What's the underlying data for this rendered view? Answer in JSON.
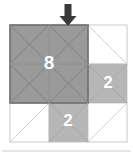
{
  "figure": {
    "title": "",
    "grid": {
      "rows": 3,
      "cols": 3,
      "origin_x": 10,
      "origin_y": 25,
      "cell_size": 39,
      "grid_line_color": "#c9c9c9",
      "cell_diagonal_color": "#d0d0d0",
      "background_color": "#ffffff"
    },
    "colors": {
      "dark_square_fill": "#9a9a9a",
      "dark_square_border": "#6e6e6e",
      "dark_square_diagonal": "#8a8a8a",
      "light_square_fill": "#b6b6b6",
      "light_square_diagonal": "#a6a6a6",
      "label_text": "#ffffff",
      "arrow": "#3a3a3a",
      "separator": "#cccccc"
    },
    "shapes": [
      {
        "name": "large-square-8",
        "label": "8",
        "area_value": 8,
        "fill": "dark",
        "col": 0,
        "row": 0,
        "span_cols": 2,
        "span_rows": 2,
        "label_x": 49,
        "label_y": 64,
        "font_size": 19
      },
      {
        "name": "right-square-2",
        "label": "2",
        "area_value": 2,
        "fill": "light",
        "col": 2,
        "row": 1,
        "span_cols": 1,
        "span_rows": 1,
        "label_x": 108,
        "label_y": 84,
        "font_size": 17
      },
      {
        "name": "bottom-square-2",
        "label": "2",
        "area_value": 2,
        "fill": "light",
        "col": 1,
        "row": 2,
        "span_cols": 1,
        "span_rows": 1,
        "label_x": 68,
        "label_y": 122,
        "font_size": 17
      }
    ],
    "arrow": {
      "name": "down-arrow",
      "direction": "down",
      "tip_x": 68,
      "tip_y": 26,
      "top_y": 4,
      "shaft_width": 7,
      "head_width": 17
    },
    "separator": {
      "name": "bottom-separator",
      "y": 151,
      "x1": 2,
      "x2": 131
    }
  }
}
